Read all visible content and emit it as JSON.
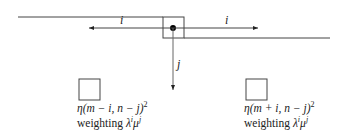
{
  "diagram": {
    "labels": {
      "left_arrow": "i",
      "right_arrow": "i",
      "down_arrow": "j"
    },
    "cells": [
      {
        "name": "left-cell",
        "formula_prefix": "η(m − i, n − j)",
        "formula_exp": "2",
        "weighting_label": "weighting",
        "weighting_formula": "λ",
        "weighting_exp1": "i",
        "weighting_mid": "μ",
        "weighting_exp2": "j"
      },
      {
        "name": "right-cell",
        "formula_prefix": "η(m + i, n − j)",
        "formula_exp": "2",
        "weighting_label": "weighting",
        "weighting_formula": "λ",
        "weighting_exp1": "i",
        "weighting_mid": "μ",
        "weighting_exp2": "j"
      }
    ]
  }
}
